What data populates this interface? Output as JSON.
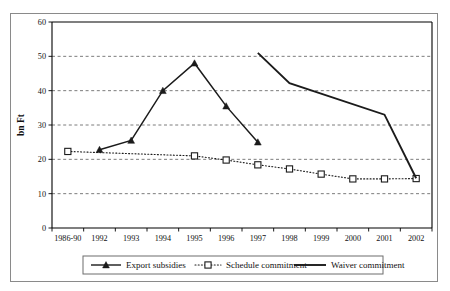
{
  "chart_data": {
    "type": "line",
    "title": "",
    "xlabel": "",
    "ylabel": "bn Ft",
    "ylim": [
      0,
      60
    ],
    "yticks": [
      0,
      10,
      20,
      30,
      40,
      50,
      60
    ],
    "grid": true,
    "legend_position": "bottom",
    "categories": [
      "1986-90",
      "1992",
      "1993",
      "1994",
      "1995",
      "1996",
      "1997",
      "1998",
      "1999",
      "2000",
      "2001",
      "2002"
    ],
    "series": [
      {
        "name": "Export subsidies",
        "marker": "triangle",
        "line_style": "solid",
        "values": [
          null,
          22.8,
          25.5,
          40.0,
          48.0,
          35.5,
          25.0,
          null,
          null,
          null,
          null,
          null
        ]
      },
      {
        "name": "Schedule commitment",
        "marker": "square",
        "line_style": "dotted",
        "values": [
          22.3,
          null,
          null,
          null,
          21.0,
          19.8,
          18.4,
          17.2,
          15.7,
          14.3,
          14.3,
          14.4
        ]
      },
      {
        "name": "Waiver commitment",
        "marker": "none",
        "line_style": "solid",
        "values": [
          null,
          null,
          null,
          null,
          null,
          null,
          51.0,
          42.2,
          null,
          null,
          33.0,
          14.5
        ]
      }
    ]
  },
  "legend": {
    "items": [
      {
        "label": "Export subsidies"
      },
      {
        "label": "Schedule commitment"
      },
      {
        "label": "Waiver commitment"
      }
    ]
  },
  "axis": {
    "y_title": "bn Ft"
  },
  "colors": {
    "ink": "#1b1b1b",
    "grid": "#5a5a5a",
    "frame": "#8a8a8a"
  }
}
